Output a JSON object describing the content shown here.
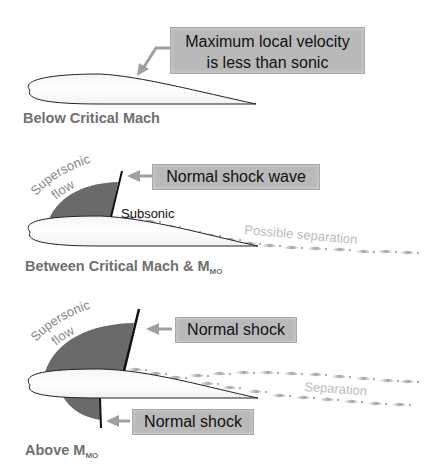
{
  "panels": [
    {
      "caption": "Below Critical Mach",
      "callout": {
        "line1": "Maximum local velocity",
        "line2": "is less than sonic"
      }
    },
    {
      "caption_main": "Between Critical Mach & M",
      "caption_sub": "MO",
      "callout": "Normal shock wave",
      "flow_label_1": "Supersonic",
      "flow_label_2": "flow",
      "subsonic_label": "Subsonic",
      "separation_label": "Possible separation"
    },
    {
      "caption_main": "Above M",
      "caption_sub": "MO",
      "callout_upper": "Normal shock",
      "callout_lower": "Normal shock",
      "flow_label_1": "Supersonic",
      "flow_label_2": "flow",
      "separation_label": "Separation"
    }
  ],
  "colors": {
    "callout_box": "#b9b9b9",
    "supersonic_region": "#6a6a6a",
    "caption_text": "#707070",
    "arrow": "#a0a0a0",
    "separation_text": "#b8b8b8"
  }
}
